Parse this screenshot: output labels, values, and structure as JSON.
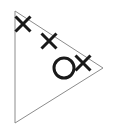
{
  "figure": {
    "canvas": {
      "width": 114,
      "height": 129,
      "background": "#ffffff"
    },
    "shapes": {
      "triangle": {
        "name": "triangle-outline",
        "points": "15,11 103,68 15,123",
        "stroke": "#8c8c8c",
        "stroke_width": 1,
        "fill": "none",
        "vertices": [
          {
            "label": "top-left-apex",
            "x": 15,
            "y": 11
          },
          {
            "label": "right-vertex",
            "x": 103,
            "y": 68
          },
          {
            "label": "bottom-left-vertex",
            "x": 15,
            "y": 123
          }
        ]
      },
      "cross_markers": [
        {
          "label": "x-marker-1",
          "x": 23,
          "y": 24,
          "size": 15,
          "stroke": "#1a1a1a",
          "stroke_width": 3
        },
        {
          "label": "x-marker-2",
          "x": 49,
          "y": 41,
          "size": 15,
          "stroke": "#1a1a1a",
          "stroke_width": 3
        },
        {
          "label": "x-marker-3",
          "x": 83,
          "y": 63,
          "size": 15,
          "stroke": "#1a1a1a",
          "stroke_width": 3
        }
      ],
      "circle_marker": {
        "label": "circle-marker",
        "cx": 64,
        "cy": 68,
        "r": 10,
        "stroke": "#1a1a1a",
        "stroke_width": 3,
        "fill": "none"
      }
    }
  }
}
